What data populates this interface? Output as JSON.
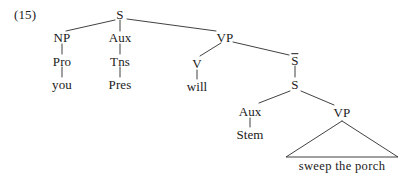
{
  "figure": {
    "example_number": "(15)",
    "sentence": "you Pres will sweep the porch",
    "stroke_color": "#2b2b2b",
    "text_color": "#1a1a1a",
    "background_color": "#ffffff"
  },
  "nodes": {
    "root_s": "S",
    "np": "NP",
    "pro": "Pro",
    "you": "you",
    "aux_top": "Aux",
    "tns": "Tns",
    "pres": "Pres",
    "vp_top": "VP",
    "v": "V",
    "will": "will",
    "s_bar": "S",
    "s_embedded": "S",
    "aux_lower": "Aux",
    "stem": "Stem",
    "vp_lower": "VP",
    "terminal_phrase": "sweep  the  porch"
  },
  "tree_structure": {
    "label": "S",
    "children": [
      {
        "label": "NP",
        "children": [
          {
            "label": "Pro",
            "children": [
              {
                "label": "you",
                "children": []
              }
            ]
          }
        ]
      },
      {
        "label": "Aux",
        "children": [
          {
            "label": "Tns",
            "children": [
              {
                "label": "Pres",
                "children": []
              }
            ]
          }
        ]
      },
      {
        "label": "VP",
        "children": [
          {
            "label": "V",
            "children": [
              {
                "label": "will",
                "children": []
              }
            ]
          },
          {
            "label": "S-bar",
            "children": [
              {
                "label": "S",
                "children": [
                  {
                    "label": "Aux",
                    "children": [
                      {
                        "label": "Stem",
                        "children": []
                      }
                    ]
                  },
                  {
                    "label": "VP",
                    "children": [
                      {
                        "label": "sweep the porch",
                        "children": [],
                        "triangle": true
                      }
                    ]
                  }
                ]
              }
            ]
          }
        ]
      }
    ]
  }
}
